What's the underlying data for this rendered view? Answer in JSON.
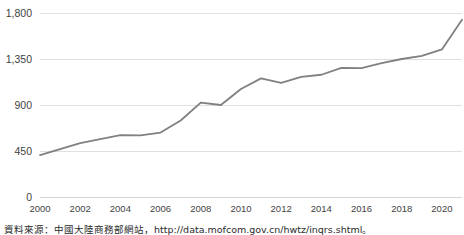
{
  "source_note": "資料來源：中國大陸商務部網站，http://data.mofcom.gov.cn/hwtz/inqrs.shtml。",
  "chart_data": {
    "type": "line",
    "title": "",
    "subtitle": "",
    "xlabel": "",
    "ylabel": "",
    "grid": "horizontal",
    "legend": "none",
    "line_color": "#808080",
    "gridline_color": "#e0e0e0",
    "x": [
      2000,
      2001,
      2002,
      2003,
      2004,
      2005,
      2006,
      2007,
      2008,
      2009,
      2010,
      2011,
      2012,
      2013,
      2014,
      2015,
      2016,
      2017,
      2018,
      2019,
      2020,
      2021
    ],
    "values": [
      410,
      469,
      527,
      565,
      606,
      603,
      630,
      748,
      924,
      900,
      1057,
      1160,
      1117,
      1176,
      1196,
      1263,
      1260,
      1310,
      1350,
      1381,
      1444,
      1735
    ],
    "x_tick_labels": [
      "2000",
      "2002",
      "2004",
      "2006",
      "2008",
      "2010",
      "2012",
      "2014",
      "2016",
      "2018",
      "2020"
    ],
    "x_ticks": [
      2000,
      2002,
      2004,
      2006,
      2008,
      2010,
      2012,
      2014,
      2016,
      2018,
      2020
    ],
    "y_tick_labels": [
      "0",
      "450",
      "900",
      "1,350",
      "1,800"
    ],
    "y_ticks": [
      0,
      450,
      900,
      1350,
      1800
    ],
    "xlim": [
      2000,
      2021
    ],
    "ylim": [
      0,
      1800
    ]
  }
}
